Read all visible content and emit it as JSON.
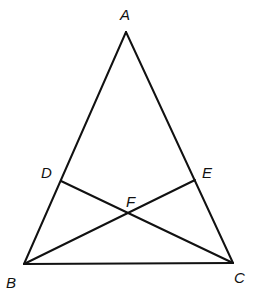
{
  "diagram": {
    "type": "geometry",
    "points": [
      {
        "id": "A",
        "label": "A"
      },
      {
        "id": "B",
        "label": "B"
      },
      {
        "id": "C",
        "label": "C"
      },
      {
        "id": "D",
        "label": "D"
      },
      {
        "id": "E",
        "label": "E"
      },
      {
        "id": "F",
        "label": "F"
      }
    ],
    "segments": [
      [
        "A",
        "B"
      ],
      [
        "A",
        "C"
      ],
      [
        "B",
        "C"
      ],
      [
        "D",
        "C"
      ],
      [
        "B",
        "E"
      ]
    ],
    "relations": {
      "D_on": [
        "A",
        "B"
      ],
      "E_on": [
        "A",
        "C"
      ],
      "F_is_intersection_of": [
        [
          "D",
          "C"
        ],
        [
          "B",
          "E"
        ]
      ]
    }
  }
}
